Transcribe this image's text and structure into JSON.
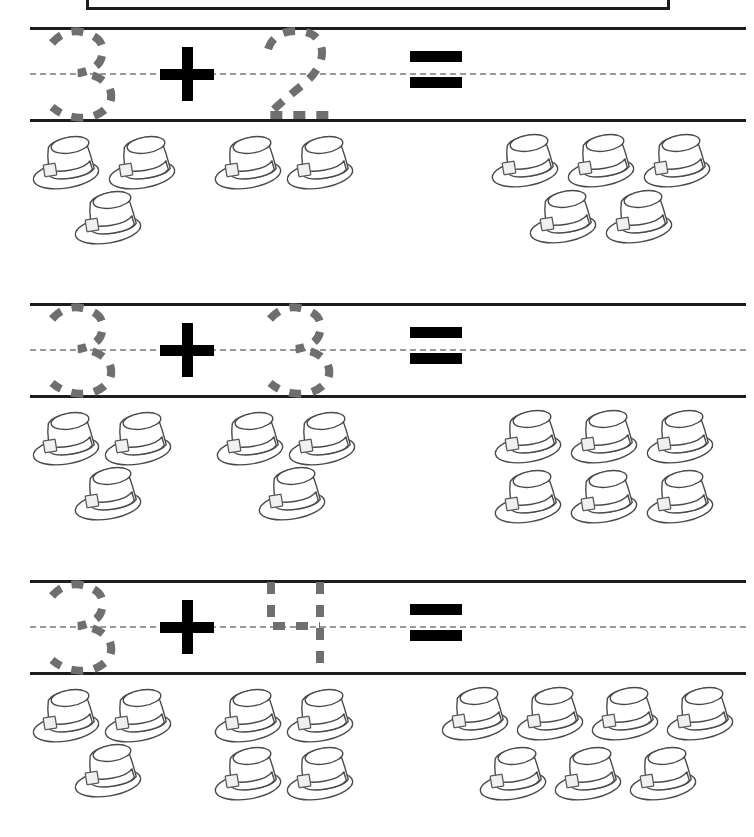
{
  "worksheet": {
    "title_box_text": "",
    "symbols": {
      "plus": "+",
      "equals": "="
    },
    "ink_colors": {
      "rule_line": "#1d1d1d",
      "dashed_midline": "#9a9a9a",
      "trace_digit": "#6f6f6f",
      "operator": "#000000",
      "hat_outline": "#4a4a4a"
    },
    "problems": [
      {
        "id": "problem-1",
        "addend_1": "3",
        "addend_2": "2",
        "sum": "5",
        "group_1_count": 3,
        "group_2_count": 2,
        "answer_count": 5,
        "object": "top-hat"
      },
      {
        "id": "problem-2",
        "addend_1": "3",
        "addend_2": "3",
        "sum": "6",
        "group_1_count": 3,
        "group_2_count": 3,
        "answer_count": 6,
        "object": "top-hat"
      },
      {
        "id": "problem-3",
        "addend_1": "3",
        "addend_2": "4",
        "sum": "7",
        "group_1_count": 3,
        "group_2_count": 4,
        "answer_count": 7,
        "object": "top-hat"
      }
    ]
  }
}
